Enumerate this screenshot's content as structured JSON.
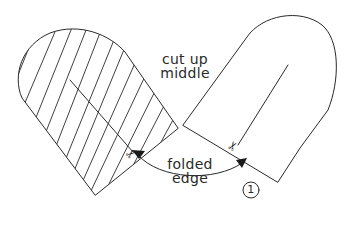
{
  "diagram": {
    "labels": {
      "cut_line1": "cut up",
      "cut_line2": "middle",
      "fold_line1": "folded",
      "fold_line2": "edge",
      "step_number": "1"
    },
    "icons": {
      "scissors": "✂"
    },
    "colors": {
      "stroke": "#2a2a2a",
      "background": "#ffffff"
    }
  }
}
